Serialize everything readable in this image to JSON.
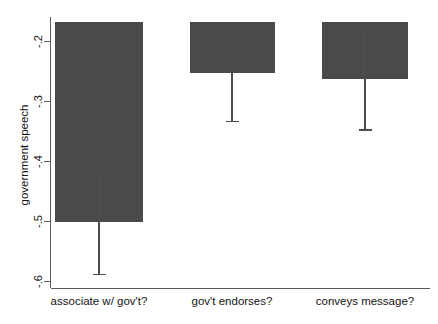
{
  "chart_data": {
    "type": "bar",
    "title": "",
    "subtitle": "",
    "xlabel": "",
    "ylabel": "government speech",
    "categories": [
      "associate w/ gov't?",
      "gov't endorses?",
      "conveys message?"
    ],
    "values": [
      -0.5,
      -0.252,
      -0.262
    ],
    "errors_low": [
      -0.588,
      -0.333,
      -0.347
    ],
    "errors_high": [
      -0.422,
      -0.171,
      -0.177
    ],
    "bar_top_value": -0.168,
    "ylim": [
      -0.63,
      -0.168
    ],
    "yticks": [
      -0.2,
      -0.3,
      -0.4,
      -0.5,
      -0.6
    ],
    "ytick_labels": [
      "-.2",
      "-.3",
      "-.4",
      "-.5",
      "-.6"
    ],
    "grid": false,
    "legend": "none",
    "bar_color": "#4a4a4a",
    "error_color": "#4d4d4d",
    "axis_color": "#5a5a5a",
    "background_color": "#ffffff",
    "series": [
      {
        "name": "government speech",
        "values": [
          -0.5,
          -0.252,
          -0.262
        ]
      }
    ]
  },
  "axis": {
    "y_title": "government speech",
    "y_tick_0": "-.2",
    "y_tick_1": "-.3",
    "y_tick_2": "-.4",
    "y_tick_3": "-.5",
    "y_tick_4": "-.6",
    "x_cat_0": "associate w/ gov't?",
    "x_cat_1": "gov't endorses?",
    "x_cat_2": "conveys message?"
  }
}
